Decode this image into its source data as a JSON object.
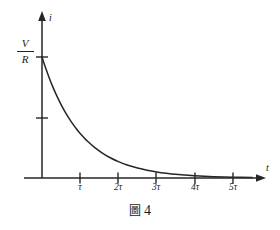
{
  "figure": {
    "caption_symbol": "圖",
    "caption_number": "4",
    "background_color": "#ffffff",
    "ink_color": "#262626"
  },
  "axes": {
    "y_axis_name": "i",
    "x_axis_name": "t",
    "y_value_numerator": "V",
    "y_value_denominator": "R",
    "x_tick_labels": [
      "τ",
      "2τ",
      "3τ",
      "4τ",
      "5τ"
    ]
  },
  "chart_data": {
    "type": "line",
    "subtitle": "",
    "xlabel": "t",
    "ylabel": "i",
    "grid": false,
    "legend": null,
    "xlim": [
      0,
      5.9
    ],
    "ylim": [
      0,
      1.18
    ],
    "x_ticks": [
      1,
      2,
      3,
      4,
      5
    ],
    "x_tick_labels": [
      "τ",
      "2τ",
      "3τ",
      "4τ",
      "5τ"
    ],
    "y_ticks": [
      0.5,
      1.0
    ],
    "y_tick_labels": [
      "",
      "V/R"
    ],
    "annotations": [
      {
        "text": "V/R",
        "x": 0,
        "y": 1.0,
        "note": "initial current value marked on i-axis"
      }
    ],
    "series": [
      {
        "name": "i = (V/R)·e^(-t/τ)",
        "x": [
          0,
          0.1,
          0.2,
          0.3,
          0.4,
          0.5,
          0.6,
          0.7,
          0.8,
          0.9,
          1.0,
          1.2,
          1.4,
          1.6,
          1.8,
          2.0,
          2.25,
          2.5,
          2.75,
          3.0,
          3.25,
          3.5,
          3.75,
          4.0,
          4.5,
          5.0,
          5.5
        ],
        "y": [
          1.0,
          0.905,
          0.819,
          0.741,
          0.67,
          0.607,
          0.549,
          0.497,
          0.449,
          0.407,
          0.368,
          0.301,
          0.247,
          0.202,
          0.165,
          0.135,
          0.105,
          0.082,
          0.064,
          0.05,
          0.039,
          0.03,
          0.024,
          0.018,
          0.011,
          0.007,
          0.004
        ]
      }
    ]
  }
}
